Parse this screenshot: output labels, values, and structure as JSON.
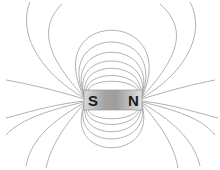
{
  "diagram": {
    "magnet": {
      "south_label": "S",
      "north_label": "N",
      "x": 84,
      "y": 90,
      "width": 58,
      "height": 20,
      "gradient": [
        "#d6d6d6",
        "#9a9a9a",
        "#b4b4b4",
        "#dedede"
      ]
    },
    "field_line_color": "#a8a8a8",
    "background": "#ffffff"
  }
}
